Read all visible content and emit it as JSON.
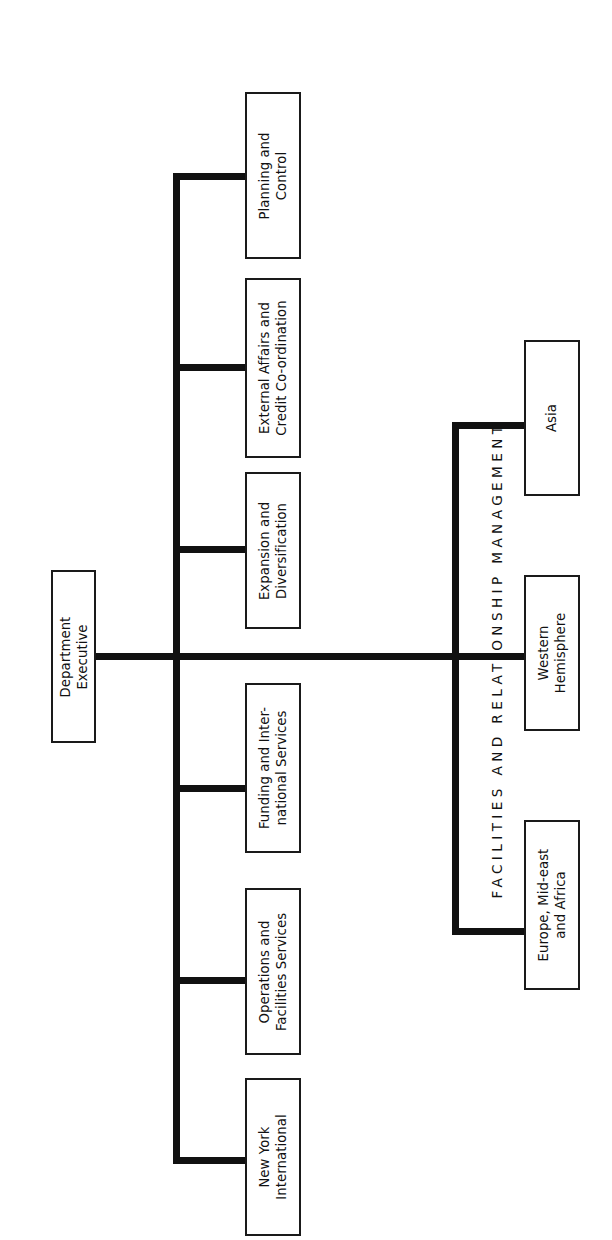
{
  "document": {
    "type": "organization-chart",
    "orientation": "rotated-90-counterclockwise",
    "root": {
      "label": "Department\nExecutive",
      "name": "department-executive"
    },
    "section_heading": {
      "text": "F A C I L I T I E S   A N D   R E L A T I O N S H I P   M A N A G E M E N T",
      "plain": "FACILITIES AND RELATIONSHIP MANAGEMENT"
    },
    "branches": [
      {
        "id": "planning-and-control",
        "label": "Planning and\nControl"
      },
      {
        "id": "external-affairs-and-credit-co-ordination",
        "label": "External Affairs and\nCredit Co-ordination"
      },
      {
        "id": "expansion-and-diversification",
        "label": "Expansion and\nDiversification"
      },
      {
        "id": "funding-and-international-services",
        "label": "Funding and Inter-\nnational Services"
      },
      {
        "id": "operations-and-facilities-services",
        "label": "Operations and\nFacilities Services"
      },
      {
        "id": "new-york-international",
        "label": "New York\nInternational"
      }
    ],
    "regional_units": [
      {
        "id": "asia",
        "label": "Asia"
      },
      {
        "id": "western-hemisphere",
        "label": "Western\nHemisphere"
      },
      {
        "id": "europe-mid-east-and-africa",
        "label": "Europe, Mid-east\nand Africa"
      }
    ],
    "colors": {
      "line": "#111111",
      "box_border": "#1a1a1a",
      "background": "#ffffff",
      "text": "#111111"
    }
  }
}
